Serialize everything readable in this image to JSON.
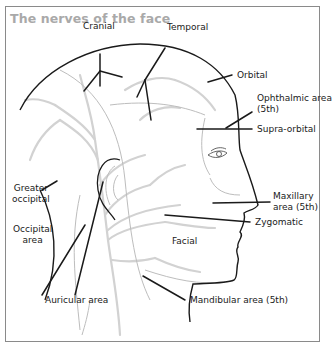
{
  "title": "The nerves of the face",
  "labels": {
    "cranial": "Cranial",
    "temporal": "Temporal",
    "orbital": "Orbital",
    "ophthalmic_line1": "Ophthalmic area",
    "ophthalmic_line2": "(5th)",
    "supra_orbital": "Supra-orbital",
    "greater_occipital_line1": "Greater",
    "greater_occipital_line2": "occipital",
    "occipital_area_line1": "Occipital",
    "occipital_area_line2": "area",
    "maxillary_line1": "Maxillary",
    "maxillary_line2": "area (5th)",
    "zygomatic": "Zygomatic",
    "facial": "Facial",
    "auricular_area": "Auricular area",
    "mandibular_area": "Mandibular area (5th)"
  },
  "colors": {
    "title": "#a9a9a9",
    "outline": "#1a1a1a",
    "nerves": "#cfcfcf",
    "frame": "#8a8a8a"
  }
}
